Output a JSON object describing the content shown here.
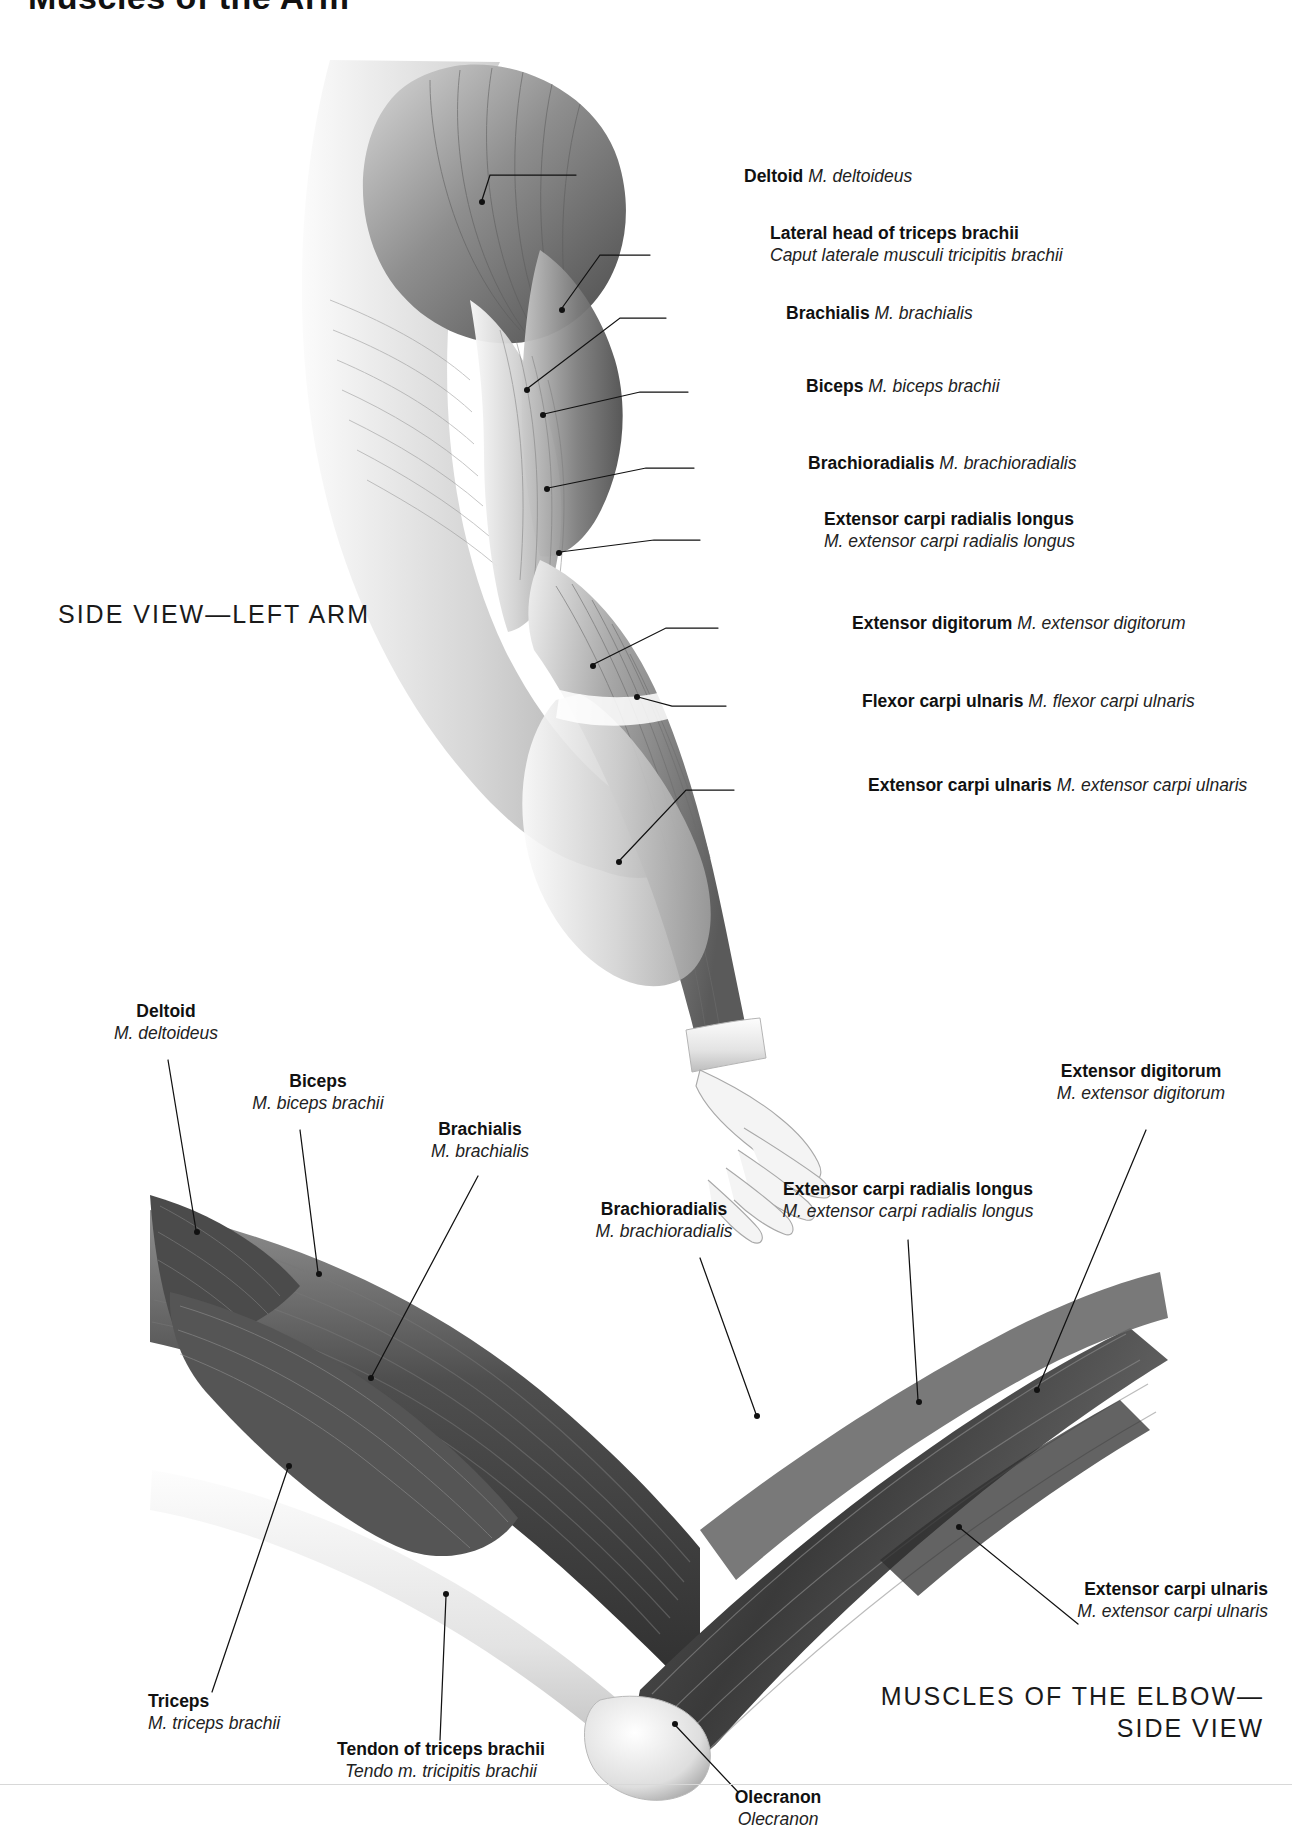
{
  "page": {
    "title": "Muscles of the Arm",
    "captions": {
      "upper_view": "SIDE VIEW—LEFT ARM",
      "lower_view_line1": "MUSCLES OF THE ELBOW—",
      "lower_view_line2": "SIDE VIEW"
    },
    "colors": {
      "text": "#111111",
      "latin_text": "#222222",
      "leader_line": "#111111",
      "background": "#ffffff",
      "artwork_light": "#f2f2f2",
      "artwork_mid": "#9a9a9a",
      "artwork_dark": "#3c3c3c"
    }
  },
  "upper_figure": {
    "name": "side-view-left-arm",
    "labels": [
      {
        "en": "Deltoid",
        "la": "M. deltoideus",
        "layout": "inline"
      },
      {
        "en": "Lateral head of triceps brachii",
        "la": "Caput laterale musculi tricipitis brachii",
        "layout": "stacked"
      },
      {
        "en": "Brachialis",
        "la": "M. brachialis",
        "layout": "inline"
      },
      {
        "en": "Biceps",
        "la": "M. biceps brachii",
        "layout": "inline"
      },
      {
        "en": "Brachioradialis",
        "la": "M. brachioradialis",
        "layout": "inline"
      },
      {
        "en": "Extensor carpi radialis longus",
        "la": "M. extensor carpi radialis longus",
        "layout": "stacked"
      },
      {
        "en": "Extensor digitorum",
        "la": "M. extensor digitorum",
        "layout": "inline"
      },
      {
        "en": "Flexor carpi ulnaris",
        "la": "M. flexor carpi ulnaris",
        "layout": "inline"
      },
      {
        "en": "Extensor carpi ulnaris",
        "la": "M. extensor carpi ulnaris",
        "layout": "inline"
      }
    ]
  },
  "lower_figure": {
    "name": "muscles-of-the-elbow-side-view",
    "labels": [
      {
        "en": "Deltoid",
        "la": "M. deltoideus",
        "layout": "stacked"
      },
      {
        "en": "Biceps",
        "la": "M. biceps brachii",
        "layout": "stacked"
      },
      {
        "en": "Brachialis",
        "la": "M. brachialis",
        "layout": "stacked"
      },
      {
        "en": "Brachioradialis",
        "la": "M. brachioradialis",
        "layout": "stacked"
      },
      {
        "en": "Extensor carpi radialis longus",
        "la": "M. extensor carpi radialis longus",
        "layout": "stacked"
      },
      {
        "en": "Extensor digitorum",
        "la": "M. extensor digitorum",
        "layout": "stacked"
      },
      {
        "en": "Extensor carpi ulnaris",
        "la": "M. extensor carpi ulnaris",
        "layout": "stacked"
      },
      {
        "en": "Triceps",
        "la": "M. triceps brachii",
        "layout": "stacked"
      },
      {
        "en": "Tendon of triceps brachii",
        "la": "Tendo m. tricipitis brachii",
        "layout": "stacked"
      },
      {
        "en": "Olecranon",
        "la": "Olecranon",
        "layout": "stacked"
      }
    ]
  }
}
